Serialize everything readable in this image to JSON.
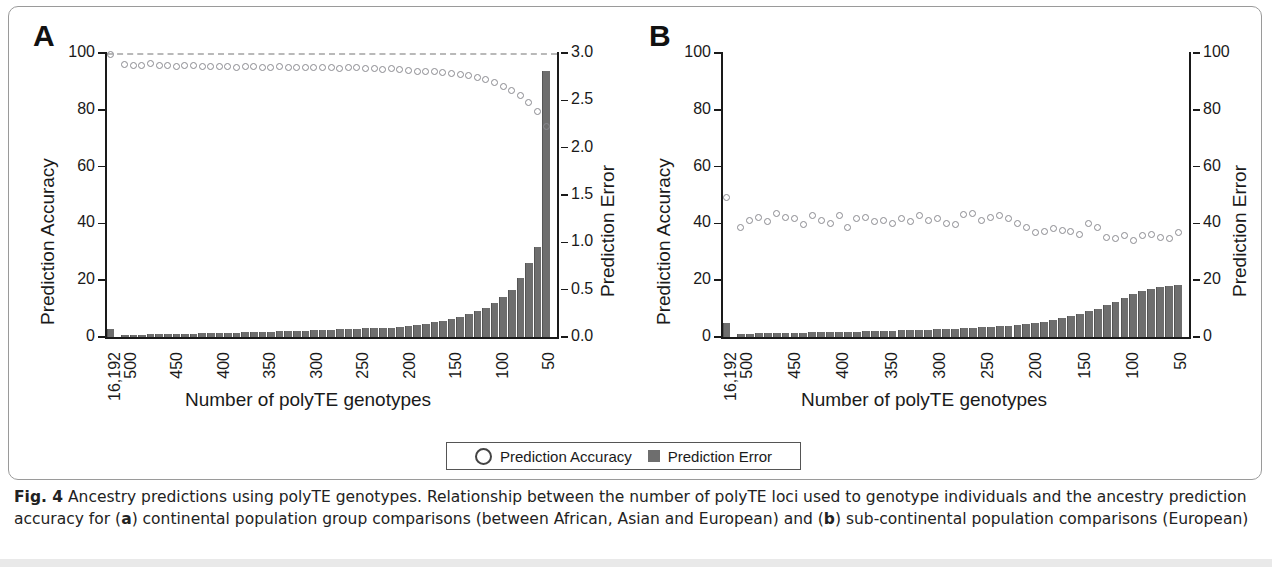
{
  "figure": {
    "label": "Fig. 4",
    "caption_rest": " Ancestry predictions using polyTE genotypes. Relationship between the number of polyTE loci used to genotype individuals and the ancestry prediction accuracy for (",
    "caption_a": "a",
    "caption_mid": ") continental population group comparisons (between African, Asian and European) and (",
    "caption_b": "b",
    "caption_end": ") sub-continental population comparisons (European)"
  },
  "legend": {
    "accuracy_label": "Prediction Accuracy",
    "error_label": "Prediction Error",
    "accuracy_marker": "open-circle",
    "error_marker": "filled-square"
  },
  "colors": {
    "bar": "#6e6e6e",
    "marker_stroke": "#8a8a90",
    "axis": "#1a1a1a",
    "gridline": "#b9b9b9",
    "border": "#9a9a9a"
  },
  "panels": {
    "a": {
      "letter": "A"
    },
    "b": {
      "letter": "B"
    }
  },
  "chart_data": [
    {
      "type": "bar",
      "panel": "A",
      "title": "",
      "xlabel": "Number of polyTE genotypes",
      "ylabel": "Prediction Accuracy",
      "y2label": "Prediction Error",
      "ylim": [
        0,
        100
      ],
      "y2lim": [
        0,
        3.0
      ],
      "yticks": [
        0,
        20,
        40,
        60,
        80,
        100
      ],
      "y2ticks": [
        0.0,
        0.5,
        1.0,
        1.5,
        2.0,
        2.5,
        3.0
      ],
      "xticks": [
        "16,192",
        "500",
        "450",
        "400",
        "350",
        "300",
        "250",
        "200",
        "150",
        "100",
        "50"
      ],
      "grid": false,
      "gridline_y": 100,
      "legend_position": "bottom-center",
      "categories": [
        16192,
        500,
        490,
        480,
        470,
        460,
        450,
        440,
        430,
        420,
        410,
        400,
        390,
        380,
        370,
        360,
        350,
        340,
        330,
        320,
        310,
        300,
        290,
        280,
        270,
        260,
        250,
        240,
        230,
        220,
        210,
        200,
        190,
        180,
        170,
        160,
        150,
        140,
        130,
        120,
        110,
        100,
        90,
        80,
        70,
        60,
        50,
        40,
        30,
        20,
        10
      ],
      "series": [
        {
          "name": "Prediction Accuracy",
          "axis": "left",
          "marker": "open-circle",
          "values": [
            99.2,
            95.6,
            95.2,
            95.4,
            95.8,
            95.3,
            95.1,
            95.0,
            95.2,
            95.4,
            95.0,
            94.8,
            95.0,
            94.9,
            94.7,
            94.8,
            94.9,
            94.6,
            94.7,
            94.8,
            94.5,
            94.6,
            94.7,
            94.4,
            94.5,
            94.6,
            94.3,
            94.4,
            94.5,
            94.2,
            94.3,
            94.0,
            94.1,
            93.8,
            93.6,
            93.3,
            93.0,
            93.1,
            92.8,
            92.4,
            92.0,
            91.6,
            91.0,
            90.2,
            89.3,
            88.0,
            86.4,
            84.6,
            82.4,
            79.0,
            74.0
          ]
        },
        {
          "name": "Prediction Error",
          "axis": "right",
          "marker": "filled-bar",
          "values": [
            0.08,
            0.02,
            0.02,
            0.02,
            0.03,
            0.03,
            0.03,
            0.03,
            0.03,
            0.03,
            0.04,
            0.04,
            0.04,
            0.04,
            0.04,
            0.05,
            0.05,
            0.05,
            0.05,
            0.06,
            0.06,
            0.06,
            0.06,
            0.07,
            0.07,
            0.07,
            0.08,
            0.08,
            0.08,
            0.09,
            0.09,
            0.1,
            0.1,
            0.11,
            0.12,
            0.13,
            0.14,
            0.16,
            0.17,
            0.19,
            0.21,
            0.24,
            0.27,
            0.31,
            0.36,
            0.42,
            0.5,
            0.62,
            0.78,
            0.95,
            2.8
          ]
        }
      ]
    },
    {
      "type": "bar",
      "panel": "B",
      "title": "",
      "xlabel": "Number of polyTE genotypes",
      "ylabel": "Prediction Accuracy",
      "y2label": "Prediction Error",
      "ylim": [
        0,
        100
      ],
      "y2lim": [
        0,
        100
      ],
      "yticks": [
        0,
        20,
        40,
        60,
        80,
        100
      ],
      "y2ticks": [
        0,
        20,
        40,
        60,
        80,
        100
      ],
      "xticks": [
        "16,192",
        "500",
        "450",
        "400",
        "350",
        "300",
        "250",
        "200",
        "150",
        "100",
        "50"
      ],
      "grid": false,
      "legend_position": "bottom-center",
      "categories": [
        16192,
        500,
        490,
        480,
        470,
        460,
        450,
        440,
        430,
        420,
        410,
        400,
        390,
        380,
        370,
        360,
        350,
        340,
        330,
        320,
        310,
        300,
        290,
        280,
        270,
        260,
        250,
        240,
        230,
        220,
        210,
        200,
        190,
        180,
        170,
        160,
        150,
        140,
        130,
        120,
        110,
        100,
        90,
        80,
        70,
        60,
        50,
        40,
        30,
        20,
        10
      ],
      "series": [
        {
          "name": "Prediction Accuracy",
          "axis": "left",
          "marker": "open-circle",
          "values": [
            49.0,
            38.5,
            41.0,
            42.0,
            40.5,
            43.5,
            42.0,
            41.5,
            39.5,
            42.5,
            41.0,
            40.0,
            42.5,
            38.5,
            41.5,
            42.0,
            40.5,
            41.0,
            40.0,
            41.5,
            40.5,
            42.5,
            41.0,
            41.5,
            40.0,
            39.5,
            43.0,
            43.5,
            41.0,
            42.0,
            42.5,
            41.5,
            40.0,
            38.5,
            36.5,
            37.0,
            38.0,
            37.5,
            37.0,
            36.0,
            40.0,
            38.5,
            35.0,
            34.5,
            35.5,
            34.0,
            35.5,
            36.0,
            35.0,
            34.5,
            36.5
          ]
        },
        {
          "name": "Prediction Error",
          "axis": "right",
          "marker": "filled-bar",
          "values": [
            5.0,
            1.2,
            1.2,
            1.3,
            1.3,
            1.4,
            1.4,
            1.5,
            1.5,
            1.6,
            1.6,
            1.7,
            1.8,
            1.8,
            1.9,
            2.0,
            2.0,
            2.1,
            2.2,
            2.3,
            2.4,
            2.5,
            2.6,
            2.7,
            2.8,
            2.9,
            3.0,
            3.2,
            3.4,
            3.6,
            3.8,
            4.0,
            4.3,
            4.6,
            5.0,
            5.4,
            6.0,
            6.6,
            7.4,
            8.2,
            9.0,
            10.0,
            11.2,
            12.4,
            13.6,
            15.0,
            16.2,
            17.0,
            17.6,
            18.0,
            18.2
          ]
        }
      ]
    }
  ]
}
